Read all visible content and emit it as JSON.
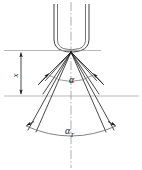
{
  "figure": {
    "background_color": "#ffffff",
    "line_color": "#1a1a1a",
    "thin_line_color": "#888888",
    "width": 142,
    "height": 170
  },
  "labels": {
    "height_dimension": "x",
    "inner_cone_angle": "α",
    "outer_cone_angle_base": "α",
    "outer_cone_angle_subscript": "T"
  },
  "elements": {
    "nozzle_name": "nozzle-body",
    "centerline_name": "vertical-centerline",
    "inner_arc_name": "inner-angle-arc",
    "outer_arc_name": "outer-angle-arc",
    "dimension_line_name": "height-dimension-line",
    "upper_reference_line_name": "upper-reference-line",
    "lower_reference_line_name": "lower-reference-line",
    "spray_rays_name": "spray-ray-group"
  }
}
